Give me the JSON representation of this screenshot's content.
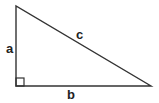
{
  "diagram": {
    "type": "right-triangle",
    "stroke_color": "#333333",
    "background": "#ffffff",
    "vertices": {
      "top": [
        16,
        6
      ],
      "right_angle": [
        16,
        86
      ],
      "right": [
        151,
        86
      ]
    },
    "right_angle_marker_size": 8,
    "labels": {
      "a": "a",
      "b": "b",
      "c": "c"
    },
    "sides": [
      {
        "name": "a",
        "description": "vertical leg"
      },
      {
        "name": "b",
        "description": "horizontal leg"
      },
      {
        "name": "c",
        "description": "hypotenuse"
      }
    ]
  }
}
